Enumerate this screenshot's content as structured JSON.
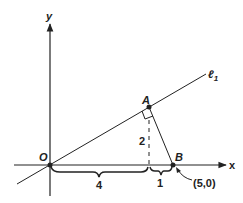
{
  "diagram": {
    "type": "coordinate-geometry",
    "axes": {
      "x_label": "x",
      "y_label": "y"
    },
    "points": {
      "origin": {
        "label": "O"
      },
      "A": {
        "label": "A"
      },
      "B": {
        "label": "B",
        "coordinate_label": "(5,0)"
      }
    },
    "line": {
      "label": "ℓ",
      "subscript": "1"
    },
    "measurements": {
      "OA_foot": "4",
      "foot_B": "1",
      "height": "2"
    },
    "colors": {
      "ink": "#222222",
      "background": "#ffffff"
    }
  }
}
